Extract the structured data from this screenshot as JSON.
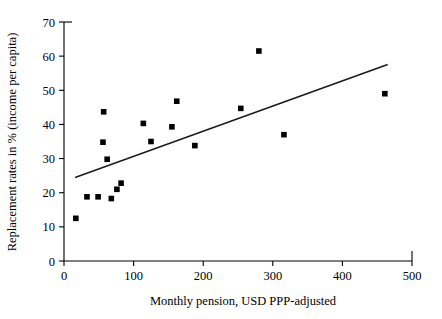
{
  "chart_data": {
    "type": "scatter",
    "title": "",
    "xlabel": "Monthly pension, USD PPP-adjusted",
    "ylabel": "Replacement rates in % (income per capita)",
    "xlim": [
      0,
      500
    ],
    "ylim": [
      0,
      70
    ],
    "xticks": [
      0,
      100,
      200,
      300,
      400,
      500
    ],
    "yticks": [
      0,
      10,
      20,
      30,
      40,
      50,
      60,
      70
    ],
    "xtick_labels": [
      "0",
      "100",
      "200",
      "300",
      "400",
      "500"
    ],
    "ytick_labels": [
      "0",
      "10",
      "20",
      "30",
      "40",
      "50",
      "60",
      "70"
    ],
    "grid": false,
    "legend": "none",
    "marker": "square",
    "marker_color": "#000000",
    "points": [
      {
        "x": 17,
        "y": 12.5
      },
      {
        "x": 33,
        "y": 18.8
      },
      {
        "x": 49,
        "y": 18.8
      },
      {
        "x": 56,
        "y": 34.8
      },
      {
        "x": 57,
        "y": 43.7
      },
      {
        "x": 62,
        "y": 29.8
      },
      {
        "x": 68,
        "y": 18.3
      },
      {
        "x": 76,
        "y": 21.0
      },
      {
        "x": 82,
        "y": 22.8
      },
      {
        "x": 114,
        "y": 40.3
      },
      {
        "x": 125,
        "y": 35.0
      },
      {
        "x": 155,
        "y": 39.3
      },
      {
        "x": 162,
        "y": 46.8
      },
      {
        "x": 188,
        "y": 33.8
      },
      {
        "x": 254,
        "y": 44.7
      },
      {
        "x": 280,
        "y": 61.5
      },
      {
        "x": 316,
        "y": 37.0
      },
      {
        "x": 461,
        "y": 49.0
      }
    ],
    "trend_line": {
      "type": "linear-fit",
      "x_start": 17,
      "y_start": 24.5,
      "x_end": 464,
      "y_end": 57.5
    }
  }
}
